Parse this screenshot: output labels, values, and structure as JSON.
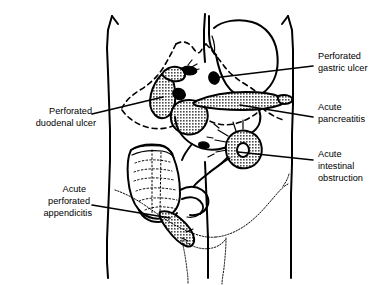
{
  "figure": {
    "type": "anatomical-line-diagram",
    "background_color": "#ffffff",
    "ink_color": "#000000",
    "hatch_color": "#555555"
  },
  "labels": [
    {
      "id": "perforated-gastric-ulcer",
      "lines": [
        "Perforated",
        "gastric ulcer"
      ],
      "line1": "Perforated",
      "line2": "gastric ulcer",
      "side": "right",
      "text_x": 318,
      "text_y": 62,
      "leader_from": [
        313,
        66
      ],
      "leader_to": [
        213,
        78
      ],
      "target": "small solid black ulcer on lesser curvature of stomach"
    },
    {
      "id": "acute-pancreatitis",
      "lines": [
        "Acute",
        "pancreatitis"
      ],
      "line1": "Acute",
      "line2": "pancreatitis",
      "side": "right",
      "text_x": 318,
      "text_y": 113,
      "leader_from": [
        313,
        117
      ],
      "leader_to": [
        240,
        105
      ],
      "target": "hatched pancreas lying transversely"
    },
    {
      "id": "acute-intestinal-obstruction",
      "lines": [
        "Acute",
        "intestinal",
        "obstruction"
      ],
      "line1": "Acute",
      "line2": "intestinal",
      "line3": "obstruction",
      "side": "right",
      "text_x": 318,
      "text_y": 166,
      "leader_from": [
        313,
        160
      ],
      "leader_to": [
        238,
        152
      ],
      "target": "hatched obstructed small bowel loop"
    },
    {
      "id": "perforated-duodenal-ulcer",
      "lines": [
        "Perforated",
        "duodenal ulcer"
      ],
      "line1": "Perforated",
      "line2": "duodenal ulcer",
      "side": "left",
      "text_x": 88,
      "text_y": 119,
      "leader_from": [
        92,
        114
      ],
      "leader_to": [
        160,
        98
      ],
      "target": "hatched duodenal loop"
    },
    {
      "id": "acute-perforated-appendicitis",
      "lines": [
        "Acute",
        "perforated",
        "appendicitis"
      ],
      "line1": "Acute",
      "line2": "perforated",
      "line3": "appendicitis",
      "side": "left",
      "text_x": 88,
      "text_y": 199,
      "leader_from": [
        92,
        205
      ],
      "leader_to": [
        165,
        215
      ],
      "target": "hatched inflamed appendix"
    }
  ],
  "structures": [
    {
      "id": "torso-outline",
      "name": "abdominal wall outline",
      "style": "solid"
    },
    {
      "id": "rib-margin",
      "name": "costal margin and diaphragm",
      "style": "dashed"
    },
    {
      "id": "stomach",
      "name": "stomach",
      "style": "solid outline"
    },
    {
      "id": "duodenum",
      "name": "duodenum",
      "style": "hatched"
    },
    {
      "id": "pancreas",
      "name": "pancreas",
      "style": "hatched"
    },
    {
      "id": "gallbladder",
      "name": "gallbladder",
      "style": "solid black"
    },
    {
      "id": "colon",
      "name": "ascending colon and caecum",
      "style": "outline with haustra"
    },
    {
      "id": "appendix",
      "name": "appendix",
      "style": "hatched"
    },
    {
      "id": "bowel-loop",
      "name": "obstructed bowel loop",
      "style": "hatched ring"
    },
    {
      "id": "pelvic-brim",
      "name": "pelvic brim and inguinal region",
      "style": "squiggle"
    }
  ]
}
